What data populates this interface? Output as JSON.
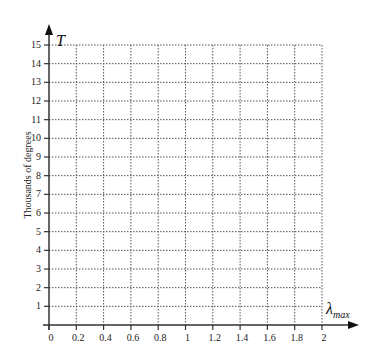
{
  "chart_data": {
    "type": "line",
    "title": "",
    "xlabel": "λ_max",
    "ylabel": "T",
    "ylabel_side": "Thousands of degrees",
    "x_ticks": [
      "0",
      "0.2",
      "0.4",
      "0.6",
      "0.8",
      "1",
      "1.2",
      "1.4",
      "1.6",
      "1.8",
      "2"
    ],
    "y_ticks": [
      "1",
      "2",
      "3",
      "4",
      "5",
      "6",
      "7",
      "8",
      "9",
      "10",
      "11",
      "12",
      "13",
      "14",
      "15"
    ],
    "xlim": [
      0,
      2
    ],
    "ylim": [
      0,
      15
    ],
    "grid": true,
    "grid_style": "dotted",
    "series": [],
    "legend": null
  },
  "labels": {
    "y_axis_symbol": "T",
    "y_axis_title": "Thousands of degrees",
    "x_axis_symbol": "λ",
    "x_axis_subscript": "max"
  },
  "colors": {
    "axis": "#333333",
    "grid": "#555555",
    "background": "#ffffff"
  }
}
